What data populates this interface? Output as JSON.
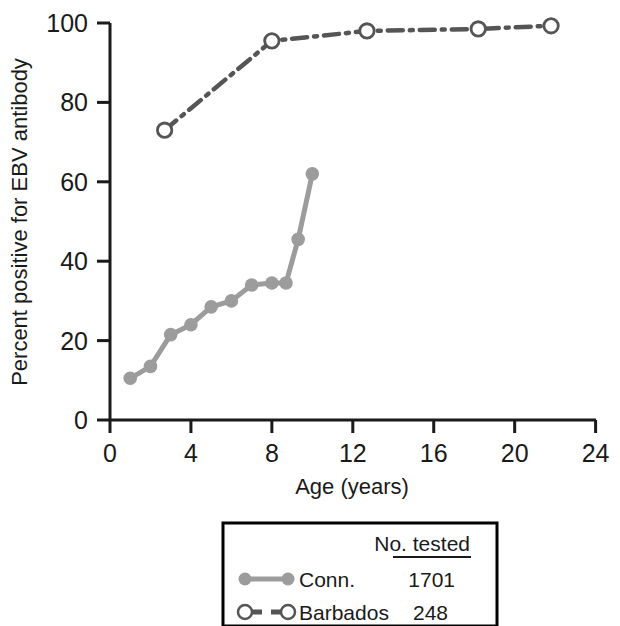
{
  "chart_data": {
    "type": "line",
    "title": "",
    "xlabel": "Age (years)",
    "ylabel": "Percent positive for EBV antibody",
    "xlim": [
      0,
      24
    ],
    "ylim": [
      0,
      100
    ],
    "xticks": [
      0,
      4,
      8,
      12,
      16,
      20,
      24
    ],
    "xtick_labels": [
      "0",
      "4",
      "8",
      "12",
      "16",
      "20",
      "24"
    ],
    "yticks": [
      0,
      20,
      40,
      60,
      80,
      100
    ],
    "ytick_labels": [
      "0",
      "20",
      "40",
      "60",
      "80",
      "100"
    ],
    "grid": false,
    "legend_position": "below-plot",
    "series": [
      {
        "name": "Conn.",
        "no_tested": "1701",
        "color": "#9c9c9c",
        "marker": "filled-circle",
        "linestyle": "solid",
        "x": [
          1,
          2,
          3,
          4,
          5,
          6,
          7,
          8,
          8.7,
          9.3,
          10
        ],
        "y": [
          10.5,
          13.5,
          21.5,
          24,
          28.5,
          30,
          34,
          34.5,
          34.5,
          45.5,
          62
        ]
      },
      {
        "name": "Barbados",
        "no_tested": "248",
        "color": "#555555",
        "marker": "open-circle",
        "linestyle": "dash-dot",
        "x": [
          2.7,
          8,
          12.7,
          18.2,
          21.8
        ],
        "y": [
          73,
          95.5,
          98,
          98.5,
          99.3
        ]
      }
    ]
  },
  "legend": {
    "column_header": "No. tested",
    "rows": [
      {
        "label": "Conn.",
        "value": "1701"
      },
      {
        "label": "Barbados",
        "value": "248"
      }
    ]
  }
}
